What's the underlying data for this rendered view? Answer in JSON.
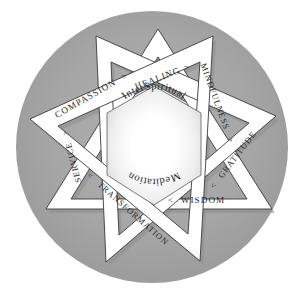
{
  "diagram": {
    "title": "InterSpiritual Meditation",
    "type": "interlocking-star-mandala",
    "center": {
      "line1": "InterSpiritual",
      "line2": "Meditation"
    },
    "colors": {
      "background": "#ffffff",
      "circle_fill": "#a6a6a6",
      "band_fill": "#ffffff",
      "band_stroke": "#3a3a3a",
      "shadow": "#8e8e8e",
      "text": "#2b2b2b",
      "core_glow": "#ffffff"
    },
    "paths": [
      {
        "id": "healing",
        "label": "HEALING",
        "marker": ">",
        "marker_side": "end"
      },
      {
        "id": "mindfulness",
        "label": "MINDFULNESS",
        "marker": ">",
        "marker_side": "end"
      },
      {
        "id": "gratitude",
        "label": "GRATITUDE",
        "marker": "<",
        "marker_side": "start"
      },
      {
        "id": "wisdom",
        "label": "WISDOM",
        "marker": "<",
        "marker_side": "start"
      },
      {
        "id": "transformation",
        "label": "TRANSFORMATION",
        "marker": "<",
        "marker_side": "start"
      },
      {
        "id": "service",
        "label": "SERVICE",
        "marker": ">",
        "marker_side": "end"
      },
      {
        "id": "compassion",
        "label": "COMPASSION",
        "marker": ">",
        "marker_side": "end"
      }
    ]
  }
}
